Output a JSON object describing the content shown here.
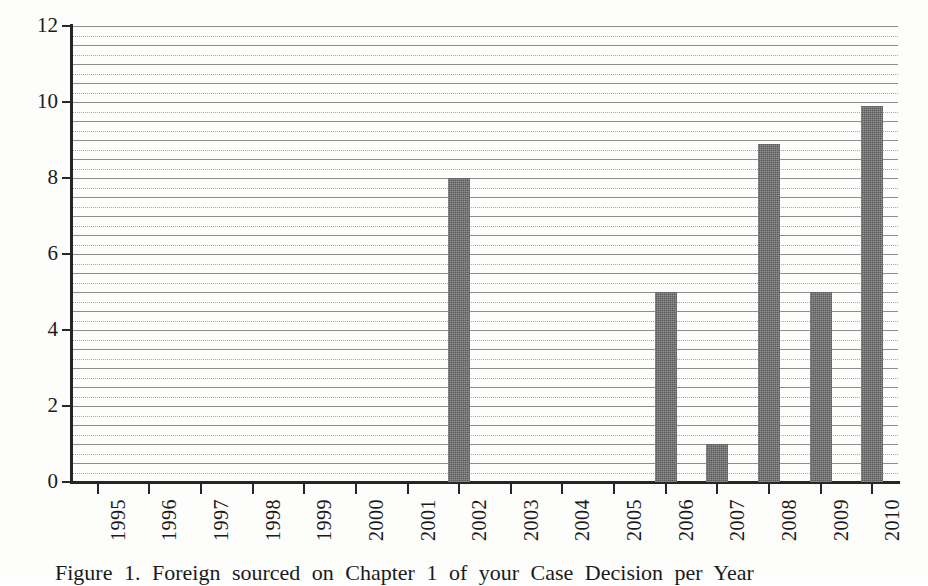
{
  "figure": {
    "caption": "Figure 1. Foreign sourced on Chapter 1 of your Case Decision per Year",
    "background_color": "#fdfdfc",
    "bar_color": "#5b5b5b",
    "axis_color": "#262626",
    "gridline_solid_color": "#8d8d8d",
    "gridline_dotted_color": "#a8a8a8"
  },
  "chart_data": {
    "type": "bar",
    "title": "",
    "xlabel": "",
    "ylabel": "",
    "categories": [
      "1995",
      "1996",
      "1997",
      "1998",
      "1999",
      "2000",
      "2001",
      "2002",
      "2003",
      "2004",
      "2005",
      "2006",
      "2007",
      "2008",
      "2009",
      "2010"
    ],
    "values": [
      0,
      0,
      0,
      0,
      0,
      0,
      0,
      8,
      0,
      0,
      0,
      5,
      1,
      8.9,
      5,
      9.9
    ],
    "ylim": [
      0,
      12
    ],
    "y_ticks": [
      0,
      2,
      4,
      6,
      8,
      10,
      12
    ],
    "y_tick_labels": [
      "0",
      "2",
      "4",
      "6",
      "8",
      "10",
      "12"
    ],
    "gridlines": {
      "enabled": true,
      "minor_interval": 0.25,
      "style": "alternating solid and dotted horizontal lines"
    },
    "legend": null,
    "x_tick_label_rotation": 90,
    "series": [
      {
        "name": "Count",
        "values": [
          0,
          0,
          0,
          0,
          0,
          0,
          0,
          8,
          0,
          0,
          0,
          5,
          1,
          8.9,
          5,
          9.9
        ]
      }
    ]
  }
}
